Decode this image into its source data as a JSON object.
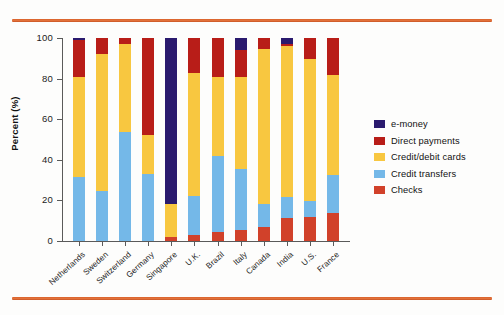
{
  "chart_data": {
    "type": "bar",
    "stacked": true,
    "title": "",
    "xlabel": "",
    "ylabel": "Percent (%)",
    "ylim": [
      0,
      100
    ],
    "yticks": [
      0,
      20,
      40,
      60,
      80,
      100
    ],
    "ytick_labels": [
      "0",
      "20",
      "40",
      "60",
      "80",
      "100"
    ],
    "grid": false,
    "legend_position": "right",
    "categories": [
      "Netherlands",
      "Sweden",
      "Switzerland",
      "Germany",
      "Singapore",
      "U.K.",
      "Brazil",
      "Italy",
      "Canada",
      "India",
      "U.S.",
      "France"
    ],
    "series": [
      {
        "name": "Checks",
        "color": "#d1412a",
        "values": [
          0,
          0,
          0,
          0,
          2.0,
          3.0,
          4.5,
          5.5,
          7.0,
          11.5,
          12.0,
          14.0
        ]
      },
      {
        "name": "Credit transfers",
        "color": "#74b8e8",
        "values": [
          31.5,
          24.5,
          53.5,
          33.0,
          0,
          19.0,
          37.5,
          30.0,
          11.0,
          10.0,
          7.5,
          18.5
        ]
      },
      {
        "name": "Credit/debit cards",
        "color": "#f8c740",
        "values": [
          49.5,
          67.5,
          43.5,
          19.0,
          16.0,
          61.0,
          39.0,
          45.5,
          76.5,
          74.5,
          70.0,
          49.5
        ]
      },
      {
        "name": "Direct payments",
        "color": "#b81d18",
        "values": [
          18.0,
          8.0,
          3.0,
          48.0,
          0,
          17.0,
          19.0,
          13.0,
          5.5,
          1.0,
          10.5,
          18.0
        ]
      },
      {
        "name": "e-money",
        "color": "#2a1a6e",
        "values": [
          1.0,
          0,
          0,
          0,
          82.0,
          0,
          0,
          6.0,
          0,
          3.0,
          0,
          0
        ]
      }
    ]
  },
  "legend": {
    "entries": [
      {
        "label": "e-money",
        "color": "#2a1a6e"
      },
      {
        "label": "Direct payments",
        "color": "#b81d18"
      },
      {
        "label": "Credit/debit cards",
        "color": "#f8c740"
      },
      {
        "label": "Credit transfers",
        "color": "#74b8e8"
      },
      {
        "label": "Checks",
        "color": "#d1412a"
      }
    ]
  },
  "decor": {
    "rule_color": "#d9622b"
  }
}
